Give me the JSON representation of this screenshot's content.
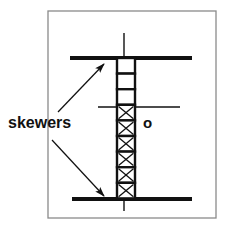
{
  "figure": {
    "title_label": "skewers",
    "marker_label": "o",
    "background_color": "#ffffff",
    "ink_color": "#111111",
    "frame_color": "#8a8a8a",
    "frame": {
      "x": 48,
      "y": 11,
      "width": 168,
      "height": 207
    },
    "skewer_axis": {
      "name": "vertical-skewer",
      "x": 124,
      "y_top": 33,
      "y_bottom": 211,
      "thickness": 1.4
    },
    "horizontal_lines": [
      {
        "name": "top-skewer",
        "x1": 70,
        "x2": 192,
        "y": 58,
        "thickness": 4
      },
      {
        "name": "middle-skewer",
        "x1": 98,
        "x2": 180,
        "y": 107,
        "thickness": 1.4
      },
      {
        "name": "bottom-skewer",
        "x1": 72,
        "x2": 192,
        "y": 199,
        "thickness": 4
      }
    ],
    "box_stack": {
      "name": "box-column",
      "x": 117,
      "y_top": 58,
      "box_width": 18,
      "box_height": 15.6,
      "count": 9,
      "border_thickness": 2.4,
      "cells": [
        {
          "index": 0,
          "fill": "empty"
        },
        {
          "index": 1,
          "fill": "empty"
        },
        {
          "index": 2,
          "fill": "empty"
        },
        {
          "index": 3,
          "fill": "crossed"
        },
        {
          "index": 4,
          "fill": "crossed"
        },
        {
          "index": 5,
          "fill": "crossed"
        },
        {
          "index": 6,
          "fill": "crossed"
        },
        {
          "index": 7,
          "fill": "crossed"
        },
        {
          "index": 8,
          "fill": "crossed"
        }
      ]
    },
    "arrows": [
      {
        "name": "arrow-to-top-skewer",
        "x1": 58,
        "y1": 112,
        "x2": 104,
        "y2": 64,
        "direction": "up-right"
      },
      {
        "name": "arrow-to-bottom-skewer",
        "x1": 52,
        "y1": 140,
        "x2": 104,
        "y2": 196,
        "direction": "down-right"
      }
    ]
  }
}
